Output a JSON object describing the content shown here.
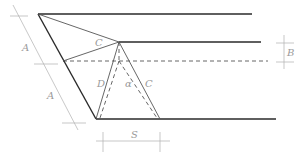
{
  "diagram": {
    "labels": {
      "C_top": "C",
      "C_right": "C",
      "D": "D",
      "alpha": "α",
      "A_upper": "A",
      "A_lower": "A",
      "B": "B",
      "S": "S"
    },
    "colors": {
      "lines": "#2a2a2a",
      "dimension": "#b0b0b0",
      "text": "#9a9a9a"
    }
  }
}
